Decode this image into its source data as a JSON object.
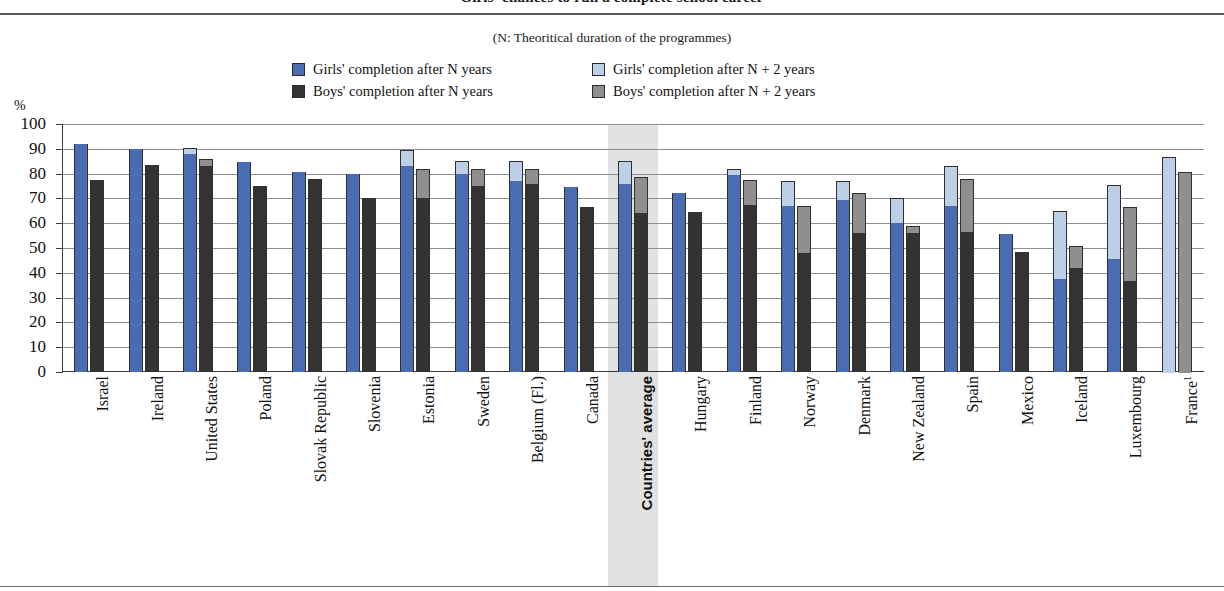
{
  "header": {
    "title": "Girls' chances to run a complete school career",
    "subtitle": "(N: Theoritical duration of  the programmes)",
    "y_unit": "%"
  },
  "legend": {
    "items": [
      {
        "label": "Girls' completion after N years",
        "color": "#4a6cb3",
        "key": "girls_n"
      },
      {
        "label": "Girls' completion after N + 2 years",
        "color": "#bdcfe6",
        "key": "girls_n2"
      },
      {
        "label": "Boys' completion after N years",
        "color": "#333333",
        "key": "boys_n"
      },
      {
        "label": "Boys' completion after N + 2 years",
        "color": "#8f8f8f",
        "key": "boys_n2"
      }
    ]
  },
  "axis": {
    "y_ticks": [
      0,
      10,
      20,
      30,
      40,
      50,
      60,
      70,
      80,
      90,
      100
    ],
    "ylim": [
      0,
      100
    ],
    "highlight_category": "Countries' average"
  },
  "chart_data": {
    "type": "bar",
    "title": "Girls' chances to run a complete school career",
    "subtitle": "(N: Theoritical duration of  the programmes)",
    "xlabel": "",
    "ylabel": "%",
    "ylim": [
      0,
      100
    ],
    "grid": true,
    "legend_position": "top",
    "stacked": "each bar is a stack: base = completion after N years, top segment = additional completion by N + 2 years",
    "categories": [
      "Israel",
      "Ireland",
      "United States",
      "Poland",
      "Slovak Republic",
      "Slovenia",
      "Estonia",
      "Sweden",
      "Belgium (Fl.)",
      "Canada",
      "Countries' average",
      "Hungary",
      "Finland",
      "Norway",
      "Denmark",
      "New Zealand",
      "Spain",
      "Mexico",
      "Iceland",
      "Luxembourg",
      "France"
    ],
    "category_notes": {
      "France": "1"
    },
    "series": [
      {
        "name": "Girls' completion after N years",
        "key": "girls_n",
        "values": [
          92.0,
          90.0,
          88.0,
          84.5,
          80.5,
          80.0,
          83.0,
          80.0,
          77.0,
          74.5,
          76.0,
          72.0,
          79.5,
          67.0,
          69.5,
          60.0,
          67.0,
          55.5,
          37.5,
          45.5,
          null
        ]
      },
      {
        "name": "Girls' completion after N + 2 years",
        "key": "girls_n2",
        "values": [
          92.0,
          90.0,
          90.5,
          84.5,
          80.5,
          80.0,
          89.5,
          85.0,
          85.0,
          74.5,
          85.0,
          72.0,
          82.0,
          77.0,
          77.0,
          70.0,
          83.0,
          55.5,
          65.0,
          75.5,
          86.5
        ]
      },
      {
        "name": "Boys' completion after N years",
        "key": "boys_n",
        "values": [
          77.5,
          83.5,
          83.0,
          75.0,
          78.0,
          70.0,
          70.0,
          75.0,
          76.0,
          66.5,
          64.0,
          64.5,
          67.5,
          48.0,
          56.0,
          56.0,
          56.5,
          48.5,
          42.0,
          36.5,
          null
        ]
      },
      {
        "name": "Boys' completion after N + 2 years",
        "key": "boys_n2",
        "values": [
          77.5,
          83.5,
          86.0,
          75.0,
          78.0,
          70.0,
          82.0,
          82.0,
          82.0,
          66.5,
          78.5,
          64.5,
          77.5,
          67.0,
          72.0,
          59.0,
          78.0,
          48.5,
          51.0,
          66.5,
          80.5
        ]
      }
    ]
  }
}
